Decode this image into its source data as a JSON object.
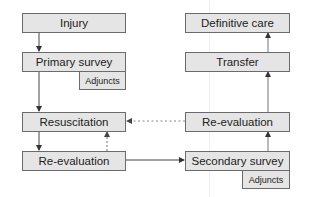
{
  "diagram": {
    "left_column": {
      "injury": "Injury",
      "primary_survey": "Primary survey",
      "primary_adjuncts": "Adjuncts",
      "resuscitation": "Resuscitation",
      "re_evaluation": "Re-evaluation"
    },
    "right_column": {
      "definitive_care": "Definitive care",
      "transfer": "Transfer",
      "re_evaluation": "Re-evaluation",
      "secondary_survey": "Secondary survey",
      "secondary_adjuncts": "Adjuncts"
    },
    "colors": {
      "box_fill": "#e5e5e5",
      "box_border": "#6b6b6b",
      "arrow": "#444444",
      "dashed_arrow": "#777777"
    }
  }
}
